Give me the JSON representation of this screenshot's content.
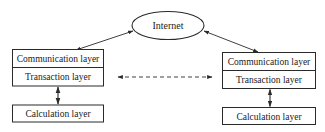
{
  "diagram": {
    "colors": {
      "stroke": "#2a2a2a",
      "background": "#ffffff",
      "text": "#222222"
    },
    "internet": {
      "label": "Internet",
      "shape": "ellipse"
    },
    "left_node": {
      "communication_layer": "Communication layer",
      "transaction_layer": "Transaction layer",
      "calculation_layer": "Calculation layer"
    },
    "right_node": {
      "communication_layer": "Communication layer",
      "transaction_layer": "Transaction layer",
      "calculation_layer": "Calculation layer"
    },
    "edges": [
      {
        "from": "internet",
        "to": "left_node.communication_layer",
        "style": "solid",
        "direction": "bidirectional"
      },
      {
        "from": "internet",
        "to": "right_node.communication_layer",
        "style": "solid",
        "direction": "bidirectional"
      },
      {
        "from": "left_node.transaction_layer",
        "to": "right_node.transaction_layer",
        "style": "dashed",
        "direction": "bidirectional"
      },
      {
        "from": "left_node.transaction_layer",
        "to": "left_node.calculation_layer",
        "style": "solid",
        "direction": "bidirectional"
      },
      {
        "from": "right_node.transaction_layer",
        "to": "right_node.calculation_layer",
        "style": "solid",
        "direction": "bidirectional"
      }
    ]
  }
}
